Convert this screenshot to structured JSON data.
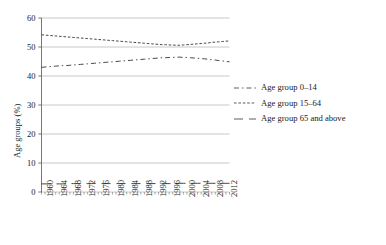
{
  "chart_data": {
    "type": "line",
    "title": "",
    "xlabel": "",
    "ylabel": "Age groups (%)",
    "ylim": [
      0,
      60
    ],
    "yticks": [
      0,
      10,
      20,
      30,
      40,
      50,
      60
    ],
    "grid": true,
    "legend_position": "right",
    "xlim": [
      1960,
      2013
    ],
    "tick_labels": [
      "1960",
      "1964",
      "1968",
      "1972",
      "1976",
      "1980",
      "1984",
      "1988",
      "1992",
      "1996",
      "2000",
      "2004",
      "2008",
      "2012"
    ],
    "x": [
      1960,
      1961,
      1962,
      1963,
      1964,
      1965,
      1966,
      1967,
      1968,
      1969,
      1970,
      1971,
      1972,
      1973,
      1974,
      1975,
      1976,
      1977,
      1978,
      1979,
      1980,
      1981,
      1982,
      1983,
      1984,
      1985,
      1986,
      1987,
      1988,
      1989,
      1990,
      1991,
      1992,
      1993,
      1994,
      1995,
      1996,
      1997,
      1998,
      1999,
      2000,
      2001,
      2002,
      2003,
      2004,
      2005,
      2006,
      2007,
      2008,
      2009,
      2010,
      2011,
      2012,
      2013
    ],
    "series": [
      {
        "name": "Age group 0–14",
        "dash": "dash-dot",
        "values": [
          43.0,
          43.1,
          43.2,
          43.3,
          43.4,
          43.5,
          43.6,
          43.6,
          43.7,
          43.8,
          43.9,
          44.0,
          44.1,
          44.2,
          44.3,
          44.4,
          44.5,
          44.6,
          44.7,
          44.8,
          44.9,
          45.0,
          45.1,
          45.2,
          45.3,
          45.4,
          45.5,
          45.6,
          45.7,
          45.8,
          45.9,
          46.0,
          46.1,
          46.2,
          46.3,
          46.3,
          46.4,
          46.4,
          46.5,
          46.5,
          46.4,
          46.4,
          46.3,
          46.2,
          46.1,
          46.0,
          45.9,
          45.8,
          45.6,
          45.5,
          45.3,
          45.2,
          45.0,
          44.9
        ]
      },
      {
        "name": "Age group 15–64",
        "dash": "fine-dash",
        "values": [
          54.2,
          54.1,
          54.0,
          53.9,
          53.8,
          53.7,
          53.6,
          53.5,
          53.4,
          53.3,
          53.2,
          53.1,
          53.0,
          52.9,
          52.8,
          52.7,
          52.6,
          52.5,
          52.4,
          52.3,
          52.2,
          52.1,
          52.0,
          51.9,
          51.8,
          51.7,
          51.6,
          51.5,
          51.4,
          51.3,
          51.2,
          51.1,
          51.0,
          50.9,
          50.8,
          50.8,
          50.7,
          50.7,
          50.6,
          50.6,
          50.7,
          50.8,
          50.9,
          51.0,
          51.1,
          51.2,
          51.3,
          51.4,
          51.6,
          51.7,
          51.8,
          51.9,
          52.0,
          52.1
        ]
      },
      {
        "name": "Age group 65 and above",
        "dash": "long-dash",
        "values": [
          2.8,
          2.8,
          2.8,
          2.8,
          2.8,
          2.8,
          2.8,
          2.9,
          2.9,
          2.9,
          2.9,
          2.9,
          2.9,
          2.9,
          2.9,
          2.9,
          2.9,
          2.9,
          2.9,
          2.9,
          2.9,
          2.9,
          2.9,
          2.9,
          2.9,
          2.9,
          2.9,
          2.9,
          2.9,
          2.9,
          2.9,
          2.9,
          2.9,
          2.9,
          2.9,
          2.9,
          2.9,
          2.9,
          2.9,
          3.0,
          3.0,
          3.0,
          3.0,
          3.0,
          3.0,
          3.0,
          3.0,
          3.0,
          3.0,
          3.0,
          3.0,
          3.0,
          3.0,
          3.0
        ]
      }
    ]
  },
  "legend": {
    "items": [
      {
        "label": "Age group 0–14"
      },
      {
        "label": "Age group 15–64"
      },
      {
        "label": "Age group 65 and above"
      }
    ]
  }
}
